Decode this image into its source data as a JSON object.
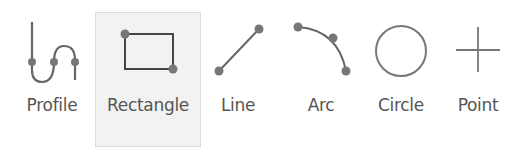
{
  "toolbar": {
    "tools": [
      {
        "id": "profile",
        "label": "Profile",
        "icon": "profile-icon",
        "active": false
      },
      {
        "id": "rectangle",
        "label": "Rectangle",
        "icon": "rectangle-icon",
        "active": true
      },
      {
        "id": "line",
        "label": "Line",
        "icon": "line-icon",
        "active": false
      },
      {
        "id": "arc",
        "label": "Arc",
        "icon": "arc-icon",
        "active": false
      },
      {
        "id": "circle",
        "label": "Circle",
        "icon": "circle-icon",
        "active": false
      },
      {
        "id": "point",
        "label": "Point",
        "icon": "point-icon",
        "active": false
      }
    ]
  },
  "colors": {
    "icon_stroke": "#555555",
    "handle_fill": "#777777",
    "label_text": "#555555",
    "active_bg": "#f2f2f2",
    "active_border": "#dcdcdc"
  }
}
